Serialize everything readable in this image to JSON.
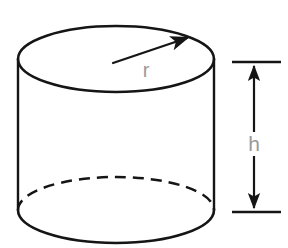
{
  "figure": {
    "background_color": "#ffffff",
    "stroke_color": "#151515",
    "label_color": "#9a9a9a",
    "shape": {
      "name": "cylinder",
      "top_ellipse": {
        "center_x": 116,
        "center_y": 59,
        "radius_x": 98,
        "radius_y": 33
      },
      "bottom_ellipse": {
        "center_x": 116,
        "center_y": 210,
        "radius_x": 98,
        "radius_y": 33,
        "front_arc_style": "solid",
        "back_arc_style": "dashed"
      },
      "left_side_x": 18,
      "right_side_x": 214,
      "side_top_y": 59,
      "side_bottom_y": 210
    },
    "radius_annotation": {
      "label": "r",
      "label_x": 146,
      "label_y": 72,
      "arrow_tail_x": 113,
      "arrow_tail_y": 63,
      "arrow_head_x": 187,
      "arrow_head_y": 38,
      "arrow_style": "single-headed"
    },
    "height_annotation": {
      "label": "h",
      "label_x": 254,
      "label_y": 144,
      "line_x": 254,
      "top_y": 62,
      "bottom_y": 212,
      "tick_left_x": 232,
      "tick_right_x": 280,
      "arrow_style": "double-headed"
    }
  }
}
